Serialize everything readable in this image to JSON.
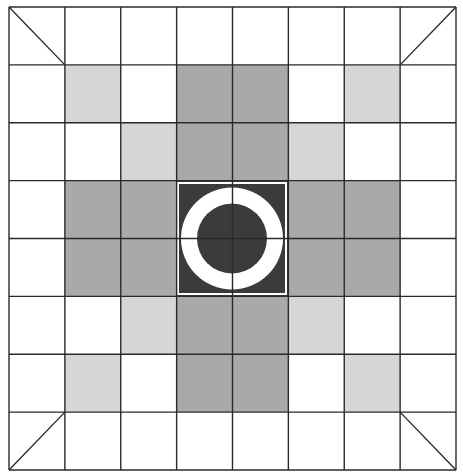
{
  "diagram": {
    "title": "",
    "grid": {
      "rows": 8,
      "cols": 8,
      "x0": 9,
      "y0": 7,
      "x1": 456,
      "y1": 470,
      "line_color": "#2a2a2a",
      "line_width": 1.4
    },
    "colors": {
      "white": "#ffffff",
      "light": "#d6d6d6",
      "mid": "#a9a9a9",
      "dark": "#3b3b3b",
      "ring": "#ffffff"
    },
    "cells": [
      [
        "W",
        "W",
        "W",
        "W",
        "W",
        "W",
        "W",
        "W"
      ],
      [
        "W",
        "L",
        "W",
        "M",
        "M",
        "W",
        "L",
        "W"
      ],
      [
        "W",
        "W",
        "L",
        "M",
        "M",
        "L",
        "W",
        "W"
      ],
      [
        "W",
        "M",
        "M",
        "C",
        "C",
        "M",
        "M",
        "W"
      ],
      [
        "W",
        "M",
        "M",
        "C",
        "C",
        "M",
        "M",
        "W"
      ],
      [
        "W",
        "W",
        "L",
        "M",
        "M",
        "L",
        "W",
        "W"
      ],
      [
        "W",
        "L",
        "W",
        "M",
        "M",
        "W",
        "L",
        "W"
      ],
      [
        "W",
        "W",
        "W",
        "W",
        "W",
        "W",
        "W",
        "W"
      ]
    ],
    "legend": {
      "W": "white",
      "L": "light",
      "M": "mid",
      "C": "dark"
    },
    "corner_diagonals": [
      {
        "cell": [
          0,
          0
        ],
        "from": "top-left",
        "to": "bottom-right"
      },
      {
        "cell": [
          0,
          7
        ],
        "from": "top-right",
        "to": "bottom-left"
      },
      {
        "cell": [
          7,
          0
        ],
        "from": "bottom-left",
        "to": "top-right"
      },
      {
        "cell": [
          7,
          7
        ],
        "from": "bottom-right",
        "to": "top-left"
      }
    ],
    "center_symbol": {
      "type": "ring-with-disc",
      "box": {
        "x": 178,
        "y": 183,
        "w": 108,
        "h": 111
      },
      "outer_radius": 51,
      "inner_radius": 35,
      "inner_border_color": "#ffffff"
    }
  }
}
